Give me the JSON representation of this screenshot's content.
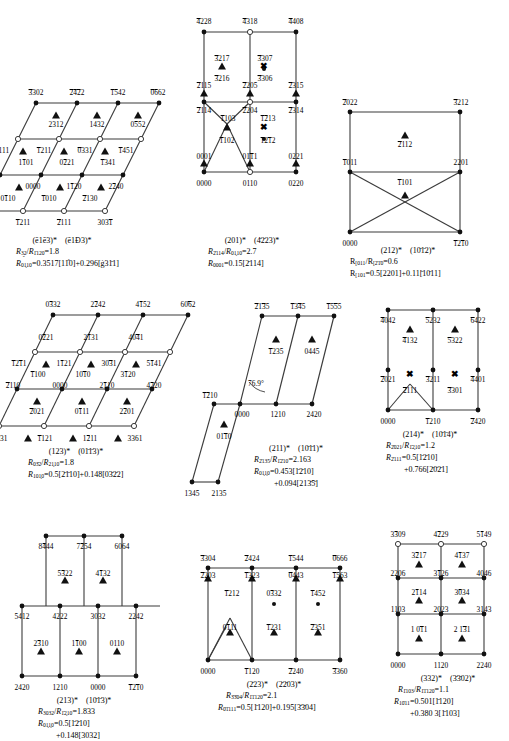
{
  "figure": {
    "kind": "kikuchi-map-panels",
    "symbols": {
      "filled_circle": "strong-reflection-spot",
      "open_circle": "weak-reflection-spot",
      "triangle": "triangle-spot-marker",
      "small_dot": "faint-spot-marker",
      "cross": "forbidden-spot-marker"
    }
  },
  "panels": [
    {
      "id": "p113",
      "zone_axes": [
        "(ē1ē3)*",
        "(ē1Đ3)*"
      ],
      "ratio": "R̅ē3̰2/R̅ē1ē20=1.8",
      "relation_line1": "R̅0ē1ē0=0.3517[11̰2̰0]+0.296[ē12̃11]",
      "ratio_num": "R",
      "ratio_sub_a": "3̰2",
      "ratio_sub_b": "1̄120",
      "ratio_val": "1.8",
      "rel_sub": "01̖10",
      "rel_text": "=0.3517[11̂0]+0.296[ġ31̄1]",
      "spots": [
        {
          "label": "3̄302",
          "type": "filled"
        },
        {
          "label": "2̄4̄2̄2",
          "type": "filled"
        },
        {
          "label": "1̄5̄42",
          "type": "filled"
        },
        {
          "label": "0̄6̄62",
          "type": "filled"
        },
        {
          "label": "2312",
          "type": "triangle"
        },
        {
          "label": "1432",
          "type": "triangle"
        },
        {
          "label": "0552",
          "type": "triangle"
        },
        {
          "label": "2111",
          "type": "open"
        },
        {
          "label": "1211",
          "type": "open"
        },
        {
          "label": "0331",
          "type": "open"
        },
        {
          "label": "1451",
          "type": "open"
        },
        {
          "label": "1101",
          "type": "triangle"
        },
        {
          "label": "0221",
          "type": "triangle"
        },
        {
          "label": "1341",
          "type": "triangle"
        },
        {
          "label": "1120",
          "type": "filled"
        },
        {
          "label": "0000",
          "type": "filled"
        },
        {
          "label": "1120",
          "type": "filled"
        },
        {
          "label": "2240",
          "type": "filled"
        },
        {
          "label": "0110",
          "type": "triangle"
        },
        {
          "label": "1010",
          "type": "triangle"
        },
        {
          "label": "2130",
          "type": "triangle"
        },
        {
          "label": "0331",
          "type": "open"
        },
        {
          "label": "1211",
          "type": "open"
        },
        {
          "label": "2111",
          "type": "open"
        },
        {
          "label": "3031",
          "type": "open"
        }
      ]
    },
    {
      "id": "p201",
      "zone_axes": [
        "(201)*",
        "(4̄2̄23)*"
      ],
      "ratio_num": "R",
      "ratio_sub_a": "2̄114",
      "ratio_sub_b": "01̖10",
      "ratio_val": "2.7",
      "rel_sub": "0001",
      "rel_text": "=0.15[2̄114]"
    },
    {
      "id": "p212",
      "zone_axes": [
        "(212)*",
        "(10̄1̄2)*"
      ],
      "ratio_num": "R",
      "ratio_sub_a": "[011",
      "ratio_sub_b": "[2̄1̄0",
      "ratio_val": "0.6",
      "rel_sub": "[101",
      "rel_text": "=0.5[2201]+0.11[̄10̄11]"
    },
    {
      "id": "p123",
      "zone_axes": [
        "(123)*",
        "(01̄1̄3)*"
      ],
      "ratio_num": "R",
      "ratio_sub_a": "03̄2",
      "ratio_sub_b": "21̖10",
      "ratio_val": "1.8",
      "rel_sub": "101̖0",
      "rel_text": "=0.5[2̄1̄10]+0.148[03̄2̄2]"
    },
    {
      "id": "p211",
      "zone_axes": [
        "(211)*",
        "(10̄1̄1)*"
      ],
      "ratio_num": "R",
      "ratio_sub_a": "2̄135",
      "ratio_sub_b": "1̄2̄10",
      "ratio_val": "2.163",
      "rel_sub": "01̖1̖0",
      "rel_text": "=0.453[1̄2̄10]",
      "rel_text2": "+0.094[213̄5̄]",
      "angle": "76.9°"
    },
    {
      "id": "p214",
      "zone_axes": [
        "(214)*",
        "(10̄1̄4)*"
      ],
      "ratio_num": "R",
      "ratio_sub_a": "2̄021",
      "ratio_sub_b": "1̄2̖10",
      "ratio_val": "1.2",
      "rel_sub": "2̄111",
      "rel_text": "=0.5[1̄2̄10]",
      "rel_text2": "+0.766[2̄0̄2̄1]"
    },
    {
      "id": "p213",
      "zone_axes": [
        "(213)*",
        "(10̄1̄3)*"
      ],
      "ratio_num": "R",
      "ratio_sub_a": "3032",
      "ratio_sub_b": "1̄2̖10",
      "ratio_val": "1.833",
      "rel_sub": "01̖1̖0",
      "rel_text": "=0.5[1̄2̄10]",
      "rel_text2": "+0.148[3032]"
    },
    {
      "id": "p223",
      "zone_axes": [
        "(2̄23)*",
        "(2̄2̄03)*"
      ],
      "ratio_num": "R",
      "ratio_sub_a": "3̄3̄04",
      "ratio_sub_b": "1̄1̄120",
      "ratio_val": "2.1",
      "rel_sub": "0̄1̄111",
      "rel_text": "=0.5[1̄120]+0.195[3̄3̄04]"
    },
    {
      "id": "p332",
      "zone_axes": [
        "(332)*",
        "(3̄3̄02)*"
      ],
      "ratio_num": "R",
      "ratio_sub_a": "1̄103",
      "ratio_sub_b": "1̄1̄120",
      "ratio_val": "1.1",
      "rel_sub": "10̄11",
      "rel_text": "=0.501[1̄120]",
      "rel_text2": "+0.380 3[1̄103]"
    }
  ]
}
